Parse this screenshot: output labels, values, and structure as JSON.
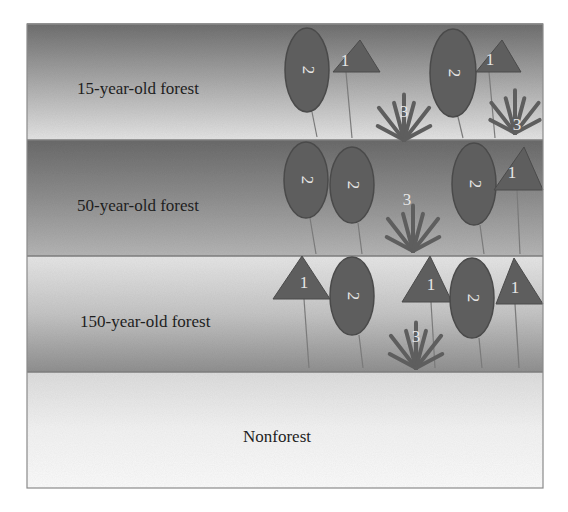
{
  "diagram": {
    "frame": {
      "x": 27,
      "y": 24,
      "width": 516,
      "height": 464
    },
    "colors": {
      "shape_fill": "#5e5e5e",
      "shape_stroke": "#4a4a4a",
      "stem": "#7a7a7a",
      "number": "#e6e6e6",
      "border": "#8a8a8a"
    },
    "bands": [
      {
        "id": "band-15",
        "label": "15-year-old forest",
        "y": 24,
        "height": 116,
        "label_x": 77,
        "label_y": 94,
        "gradient": [
          "#6f6f6f",
          "#a9a9a9",
          "#e4e4e4"
        ]
      },
      {
        "id": "band-50",
        "label": "50-year-old forest",
        "y": 140,
        "height": 116,
        "label_x": 77,
        "label_y": 211,
        "gradient": [
          "#6a6a6a",
          "#8e8e8e",
          "#b5b5b5"
        ]
      },
      {
        "id": "band-150",
        "label": "150-year-old forest",
        "y": 256,
        "height": 116,
        "label_x": 80,
        "label_y": 327,
        "gradient": [
          "#e6e6e6",
          "#c4c4c4",
          "#8f8f8f"
        ]
      },
      {
        "id": "band-nonforest",
        "label": "Nonforest",
        "y": 372,
        "height": 116,
        "label_x": 243,
        "label_y": 442,
        "gradient": [
          "#dcdcdc",
          "#f2f2f2",
          "#fafafa"
        ]
      }
    ],
    "legend_note": "1 = triangle tree, 2 = oval tree, 3 = fern-like plant",
    "elements": [
      {
        "band": "15",
        "type": "oval",
        "label": "2",
        "cx": 307,
        "cy": 70,
        "rx": 22,
        "ry": 42,
        "stem": [
          312,
          112,
          317,
          137
        ]
      },
      {
        "band": "15",
        "type": "triangle",
        "label": "1",
        "points": "333,72 380,72 360,40",
        "text_x": 345,
        "text_y": 70,
        "stem": [
          346,
          72,
          352,
          138
        ]
      },
      {
        "band": "15",
        "type": "fern",
        "label": "3",
        "base_x": 404,
        "base_y": 140,
        "size": 48,
        "text_x": 404,
        "text_y": 113
      },
      {
        "band": "15",
        "type": "oval",
        "label": "2",
        "cx": 453,
        "cy": 73,
        "rx": 23,
        "ry": 44,
        "stem": [
          458,
          117,
          463,
          138
        ]
      },
      {
        "band": "15",
        "type": "triangle",
        "label": "1",
        "points": "476,72 521,72 502,40",
        "text_x": 490,
        "text_y": 69,
        "stem": [
          489,
          72,
          495,
          138
        ]
      },
      {
        "band": "15",
        "type": "fern",
        "label": "3",
        "base_x": 515,
        "base_y": 133,
        "size": 45,
        "text_x": 517,
        "text_y": 126
      },
      {
        "band": "50",
        "type": "oval",
        "label": "2",
        "cx": 306,
        "cy": 180,
        "rx": 22,
        "ry": 38,
        "stem": [
          310,
          218,
          316,
          254
        ]
      },
      {
        "band": "50",
        "type": "oval",
        "label": "2",
        "cx": 352,
        "cy": 185,
        "rx": 22,
        "ry": 38,
        "stem": [
          358,
          223,
          362,
          254
        ]
      },
      {
        "band": "50",
        "type": "fern",
        "label": "3",
        "base_x": 413,
        "base_y": 251,
        "size": 48,
        "text_x": 407,
        "text_y": 201
      },
      {
        "band": "50",
        "type": "oval",
        "label": "2",
        "cx": 474,
        "cy": 184,
        "rx": 22,
        "ry": 41,
        "stem": [
          480,
          225,
          484,
          254
        ]
      },
      {
        "band": "50",
        "type": "triangle",
        "label": "1",
        "points": "494,190 543,190 524,147",
        "text_x": 512,
        "text_y": 182,
        "stem": [
          517,
          190,
          520,
          254
        ]
      },
      {
        "band": "150",
        "type": "triangle",
        "label": "1",
        "points": "273,299 330,299 302,256",
        "text_x": 304,
        "text_y": 292,
        "stem": [
          304,
          299,
          309,
          368
        ]
      },
      {
        "band": "150",
        "type": "oval",
        "label": "2",
        "cx": 352,
        "cy": 296,
        "rx": 22,
        "ry": 39,
        "stem": [
          359,
          335,
          363,
          368
        ]
      },
      {
        "band": "150",
        "type": "triangle",
        "label": "1",
        "points": "402,302 452,302 430,256",
        "text_x": 431,
        "text_y": 294,
        "stem": [
          431,
          302,
          435,
          368
        ]
      },
      {
        "band": "150",
        "type": "fern",
        "label": "3",
        "base_x": 416,
        "base_y": 368,
        "size": 48,
        "text_x": 416,
        "text_y": 338
      },
      {
        "band": "150",
        "type": "oval",
        "label": "2",
        "cx": 472,
        "cy": 298,
        "rx": 22,
        "ry": 40,
        "stem": [
          479,
          338,
          482,
          368
        ]
      },
      {
        "band": "150",
        "type": "triangle",
        "label": "1",
        "points": "496,304 543,304 514,258",
        "text_x": 515,
        "text_y": 297,
        "stem": [
          515,
          304,
          519,
          368
        ]
      }
    ]
  }
}
